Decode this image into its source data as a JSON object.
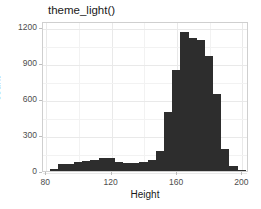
{
  "figure": {
    "title": "theme_light()",
    "background": "#ffffff",
    "panel_border": "#cfcfcf",
    "bar_color": "#2d2d2d",
    "grid_color": "#e9e9e9",
    "tick_text_color": "#4d4d4d"
  },
  "axes": {
    "x": {
      "label": "Height",
      "ticks": [
        "80",
        "120",
        "160",
        "200"
      ],
      "tick_values": [
        80,
        120,
        160,
        200
      ],
      "limits": [
        78,
        204
      ]
    },
    "y": {
      "label": "count",
      "ticks": [
        "0",
        "300",
        "600",
        "900",
        "1200"
      ],
      "tick_values": [
        0,
        300,
        600,
        900,
        1200
      ],
      "limits": [
        0,
        1250
      ]
    }
  },
  "chart_data": {
    "type": "bar",
    "title": "theme_light()",
    "xlabel": "Height",
    "ylabel": "count",
    "xlim": [
      78,
      204
    ],
    "ylim": [
      0,
      1250
    ],
    "grid": true,
    "legend": "none",
    "binwidth": 5,
    "bin_starts": [
      82,
      87,
      92,
      97,
      102,
      107,
      112,
      117,
      122,
      127,
      132,
      137,
      142,
      147,
      152,
      157,
      162,
      167,
      172,
      177,
      182,
      187,
      192,
      197
    ],
    "categories": [
      "82",
      "87",
      "92",
      "97",
      "102",
      "107",
      "112",
      "117",
      "122",
      "127",
      "132",
      "137",
      "142",
      "147",
      "152",
      "157",
      "162",
      "167",
      "172",
      "177",
      "182",
      "187",
      "192",
      "197"
    ],
    "values": [
      20,
      55,
      60,
      75,
      85,
      95,
      110,
      110,
      75,
      70,
      70,
      75,
      95,
      165,
      490,
      840,
      1160,
      1105,
      1090,
      955,
      640,
      180,
      45,
      10
    ]
  }
}
